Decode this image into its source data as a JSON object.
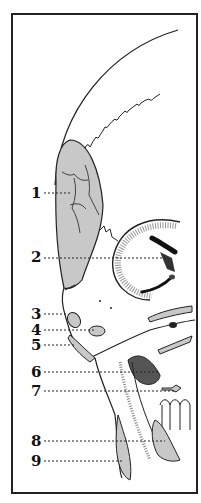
{
  "figure": {
    "type": "anatomical-illustration",
    "colors": {
      "outline": "#222222",
      "fill": "#c8c8c8",
      "background": "#ffffff"
    }
  },
  "labels": [
    {
      "num": "1",
      "x": 31,
      "y": 186,
      "leader_to": 72
    },
    {
      "num": "2",
      "x": 31,
      "y": 250,
      "leader_to": 168
    },
    {
      "num": "3",
      "x": 31,
      "y": 307,
      "leader_to": 62
    },
    {
      "num": "4",
      "x": 31,
      "y": 323,
      "leader_to": 95
    },
    {
      "num": "5",
      "x": 31,
      "y": 338,
      "leader_to": 75
    },
    {
      "num": "6",
      "x": 31,
      "y": 365,
      "leader_to": 160
    },
    {
      "num": "7",
      "x": 31,
      "y": 384,
      "leader_to": 175
    },
    {
      "num": "8",
      "x": 31,
      "y": 434,
      "leader_to": 165
    },
    {
      "num": "9",
      "x": 31,
      "y": 454,
      "leader_to": 122
    }
  ]
}
